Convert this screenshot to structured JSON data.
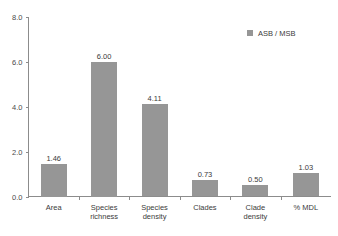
{
  "chart_data": {
    "type": "bar",
    "title": "",
    "subtitle": "",
    "xlabel": "",
    "ylabel": "",
    "categories": [
      "Area",
      "Species richness",
      "Species density",
      "Clades",
      "Clade density",
      "% MDL"
    ],
    "category_lines": [
      [
        "Area"
      ],
      [
        "Species",
        "richness"
      ],
      [
        "Species",
        "density"
      ],
      [
        "Clades"
      ],
      [
        "Clade",
        "density"
      ],
      [
        "% MDL"
      ]
    ],
    "values": [
      1.46,
      6.0,
      4.11,
      0.73,
      0.5,
      1.03
    ],
    "value_labels": [
      "1.46",
      "6.00",
      "4.11",
      "0.73",
      "0.50",
      "1.03"
    ],
    "series": [
      {
        "name": "ASB / MSB",
        "values": [
          1.46,
          6.0,
          4.11,
          0.73,
          0.5,
          1.03
        ],
        "color": "#969696"
      }
    ],
    "ylim": [
      0.0,
      8.0
    ],
    "yticks": [
      0.0,
      2.0,
      4.0,
      6.0,
      8.0
    ],
    "ytick_labels": [
      "0.0",
      "2.0",
      "4.0",
      "6.0",
      "8.0"
    ],
    "grid": false,
    "legend": {
      "position": "top-right",
      "entries": [
        {
          "label": "ASB / MSB",
          "color": "#969696",
          "swatch": "square-swatch-icon"
        }
      ]
    },
    "colors": {
      "bar": "#969696",
      "axis": "#8c8c8c",
      "text": "#3b3b3b",
      "background": "#ffffff"
    }
  }
}
